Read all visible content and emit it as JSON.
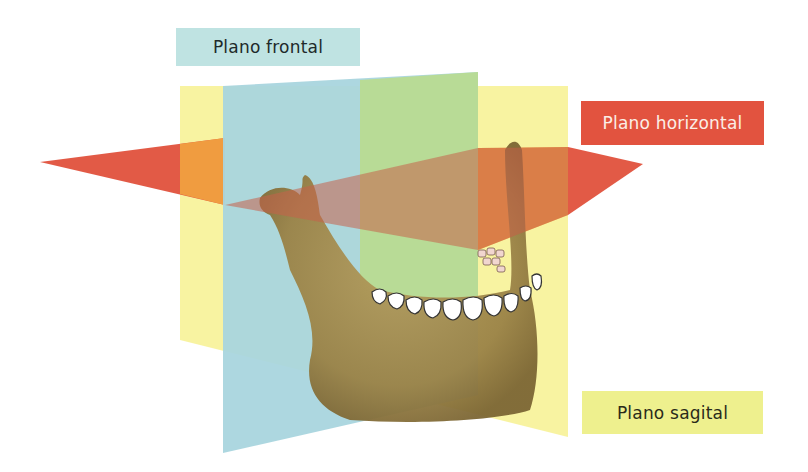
{
  "diagram": {
    "labels": {
      "frontal": "Plano frontal",
      "horizontal": "Plano horizontal",
      "sagital": "Plano sagital"
    },
    "colors": {
      "frontal_plane": "#a9d6dc",
      "frontal_label_bg": "#bfe3e2",
      "horizontal_plane": "#e0513c",
      "horizontal_label_bg": "#e2533f",
      "sagital_plane": "#f6f29a",
      "sagital_label_bg": "#eef08e",
      "bone": "#a08a4e",
      "teeth": "#ffffff"
    }
  }
}
